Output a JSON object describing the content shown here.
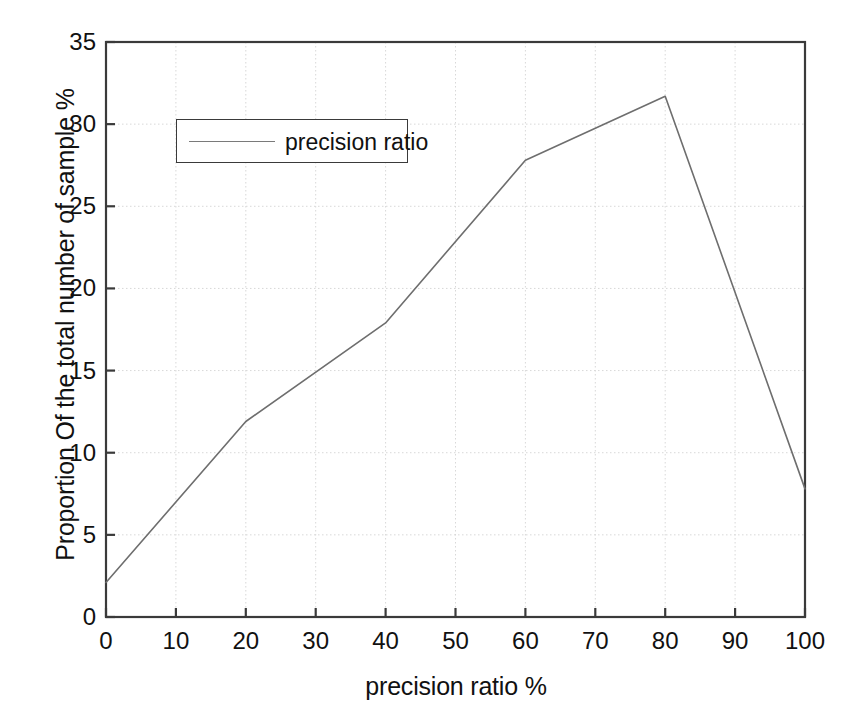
{
  "chart_data": {
    "type": "line",
    "title": "",
    "xlabel": "precision ratio %",
    "ylabel": "Proportion Of the total number of sample %",
    "xlim": [
      0,
      100
    ],
    "ylim": [
      0,
      35
    ],
    "xticks": [
      0,
      10,
      20,
      30,
      40,
      50,
      60,
      70,
      80,
      90,
      100
    ],
    "yticks": [
      0,
      5,
      10,
      15,
      20,
      25,
      30,
      35
    ],
    "grid": true,
    "legend_position": "upper-left",
    "series": [
      {
        "name": "precision ratio",
        "color": "#6e6e6e",
        "x": [
          0,
          20,
          40,
          60,
          80,
          100
        ],
        "values": [
          2.1,
          11.9,
          17.9,
          27.8,
          31.7,
          7.8
        ]
      }
    ]
  },
  "legend": {
    "entries": [
      {
        "label": "precision ratio"
      }
    ]
  },
  "axes": {
    "y_title": "Proportion Of the total number of sample %",
    "x_title": "precision ratio %",
    "y_tick_labels": [
      "0",
      "5",
      "10",
      "15",
      "20",
      "25",
      "30",
      "35"
    ],
    "x_tick_labels": [
      "0",
      "10",
      "20",
      "30",
      "40",
      "50",
      "60",
      "70",
      "80",
      "90",
      "100"
    ]
  },
  "colors": {
    "line": "#6e6e6e",
    "axis": "#3a3a3a",
    "grid": "#d8d8d8",
    "text": "#111111",
    "background": "#ffffff"
  },
  "scan_artifact": {
    "top_text": ""
  }
}
